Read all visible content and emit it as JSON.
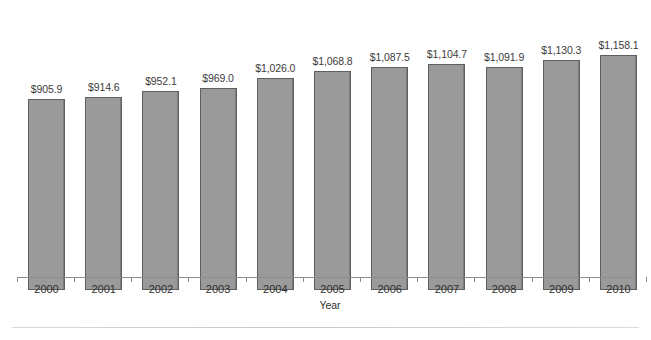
{
  "chart_data": {
    "type": "bar",
    "title": "",
    "subtitle": "",
    "xlabel": "Year",
    "ylabel": "",
    "grid": false,
    "legend": "none",
    "axis_note": "value axis not drawn; bars truncated (do not start at zero)",
    "categories": [
      "2000",
      "2001",
      "2002",
      "2003",
      "2004",
      "2005",
      "2006",
      "2007",
      "2008",
      "2009",
      "2010"
    ],
    "values": [
      905.9,
      914.6,
      952.1,
      969.0,
      1026.0,
      1068.8,
      1087.5,
      1104.7,
      1091.9,
      1130.3,
      1158.1
    ],
    "data_labels": [
      "$905.9",
      "$914.6",
      "$952.1",
      "$969.0",
      "$1,026.0",
      "$1,068.8",
      "$1,087.5",
      "$1,104.7",
      "$1,091.9",
      "$1,130.3",
      "$1,158.1"
    ],
    "value_prefix": "$",
    "ylim": [
      880,
      1175
    ]
  },
  "style": {
    "bar_fill": "#9a9a9a",
    "bar_border": "#5f5f5f",
    "axis_color": "#8d8d8d",
    "text_color": "#2f2f2f",
    "background": "#ffffff",
    "rule_color": "#d0d0d0"
  }
}
